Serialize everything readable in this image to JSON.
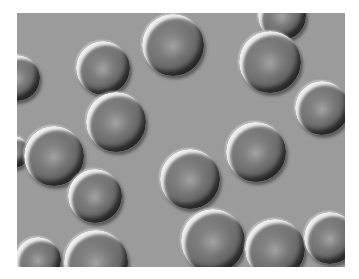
{
  "image": {
    "description": "Differential interference contrast micrograph of red blood cells",
    "background_color": "#9b9b9b",
    "border_color": "#ffffff",
    "cells": [
      {
        "cx": 103,
        "cy": 68,
        "r": 27
      },
      {
        "cx": 173,
        "cy": 45,
        "r": 31
      },
      {
        "cx": 282,
        "cy": 16,
        "r": 24
      },
      {
        "cx": 270,
        "cy": 62,
        "r": 31
      },
      {
        "cx": 322,
        "cy": 108,
        "r": 27
      },
      {
        "cx": 17,
        "cy": 78,
        "r": 23
      },
      {
        "cx": 116,
        "cy": 122,
        "r": 30
      },
      {
        "cx": 14,
        "cy": 152,
        "r": 16
      },
      {
        "cx": 54,
        "cy": 156,
        "r": 30
      },
      {
        "cx": 95,
        "cy": 196,
        "r": 27
      },
      {
        "cx": 190,
        "cy": 179,
        "r": 30
      },
      {
        "cx": 256,
        "cy": 152,
        "r": 30
      },
      {
        "cx": 213,
        "cy": 241,
        "r": 32
      },
      {
        "cx": 275,
        "cy": 249,
        "r": 30
      },
      {
        "cx": 330,
        "cy": 238,
        "r": 26
      },
      {
        "cx": 38,
        "cy": 260,
        "r": 23
      },
      {
        "cx": 96,
        "cy": 262,
        "r": 32
      }
    ]
  }
}
